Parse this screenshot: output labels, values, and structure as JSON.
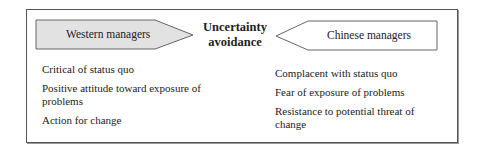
{
  "diagram": {
    "center_label": [
      "Uncertainty",
      "avoidance"
    ],
    "left": {
      "title": "Western managers",
      "fill": "#e2e2e2",
      "items": [
        "Critical of  status quo",
        "Positive attitude toward exposure of problems",
        "Action for change"
      ]
    },
    "right": {
      "title": "Chinese managers",
      "fill": "#ffffff",
      "items": [
        "Complacent  with status quo",
        "Fear of exposure of problems",
        "Resistance to potential threat of change"
      ]
    }
  }
}
